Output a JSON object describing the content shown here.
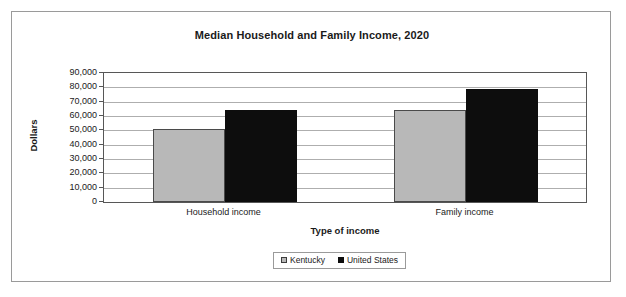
{
  "figure": {
    "title": "Median Household and Family Income, 2020"
  },
  "legend": {
    "entries": [
      {
        "label": "Kentucky",
        "color": "#b8b8b8"
      },
      {
        "label": "United States",
        "color": "#0d0d0d"
      }
    ]
  },
  "axes": {
    "x_title": "Type of income",
    "y_title": "Dollars",
    "y_ticks": [
      "90,000",
      "80,000",
      "70,000",
      "60,000",
      "50,000",
      "40,000",
      "30,000",
      "20,000",
      "10,000",
      "0"
    ]
  },
  "chart_data": {
    "type": "bar",
    "title": "Median Household and Family Income, 2020",
    "xlabel": "Type of income",
    "ylabel": "Dollars",
    "categories": [
      "Household income",
      "Family income"
    ],
    "series": [
      {
        "name": "Kentucky",
        "color": "#b8b8b8",
        "values": [
          51200,
          64400
        ]
      },
      {
        "name": "United States",
        "color": "#0d0d0d",
        "values": [
          64400,
          78900
        ]
      }
    ],
    "ylim": [
      0,
      90000
    ],
    "ytick_step": 10000,
    "grid": true,
    "legend_position": "bottom"
  }
}
